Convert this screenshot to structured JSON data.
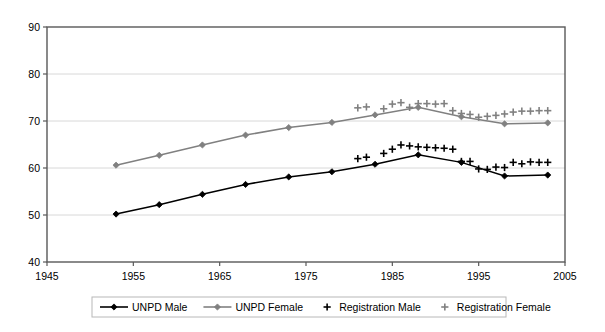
{
  "chart_data": {
    "type": "line",
    "title": "",
    "subtitle": "",
    "xlabel": "",
    "ylabel": "",
    "xlim": [
      1945,
      2005
    ],
    "ylim": [
      40,
      90
    ],
    "xticks": [
      1945,
      1955,
      1965,
      1975,
      1985,
      1995,
      2005
    ],
    "yticks": [
      40,
      50,
      60,
      70,
      80,
      90
    ],
    "grid": "horizontal",
    "legend_position": "bottom",
    "series": [
      {
        "name": "UNPD Male",
        "style": "line-marker",
        "color": "#000000",
        "marker": "diamond",
        "x": [
          1953,
          1958,
          1963,
          1968,
          1973,
          1978,
          1983,
          1988,
          1993,
          1998,
          2003
        ],
        "values": [
          50.2,
          52.2,
          54.4,
          56.5,
          58.1,
          59.2,
          60.8,
          62.8,
          61.2,
          58.3,
          58.5
        ]
      },
      {
        "name": "UNPD Female",
        "style": "line-marker",
        "color": "#808080",
        "marker": "diamond",
        "x": [
          1953,
          1958,
          1963,
          1968,
          1973,
          1978,
          1983,
          1988,
          1993,
          1998,
          2003
        ],
        "values": [
          60.6,
          62.7,
          64.9,
          67.0,
          68.6,
          69.7,
          71.3,
          72.9,
          70.9,
          69.4,
          69.6
        ]
      },
      {
        "name": "Registration Male",
        "style": "markers-only",
        "color": "#000000",
        "marker": "plus",
        "x": [
          1981,
          1982,
          1984,
          1985,
          1986,
          1987,
          1988,
          1989,
          1990,
          1991,
          1992,
          1993,
          1994,
          1995,
          1996,
          1997,
          1998,
          1999,
          2000,
          2001,
          2002,
          2003
        ],
        "values": [
          62.0,
          62.3,
          63.1,
          64.0,
          64.9,
          64.7,
          64.5,
          64.4,
          64.3,
          64.2,
          64.0,
          61.4,
          61.4,
          59.8,
          59.7,
          60.2,
          60.1,
          61.2,
          60.9,
          61.3,
          61.2,
          61.2
        ]
      },
      {
        "name": "Registration Female",
        "style": "markers-only",
        "color": "#808080",
        "marker": "plus",
        "x": [
          1981,
          1982,
          1984,
          1985,
          1986,
          1987,
          1988,
          1989,
          1990,
          1991,
          1992,
          1993,
          1994,
          1995,
          1996,
          1997,
          1998,
          1999,
          2000,
          2001,
          2002,
          2003
        ],
        "values": [
          72.8,
          73.0,
          72.6,
          73.6,
          73.9,
          72.9,
          73.7,
          73.7,
          73.6,
          73.7,
          72.2,
          71.6,
          71.4,
          70.8,
          71.0,
          71.2,
          71.5,
          71.9,
          72.1,
          72.1,
          72.2,
          72.2
        ]
      }
    ]
  },
  "legend": {
    "items": [
      {
        "label": "UNPD Male"
      },
      {
        "label": "UNPD Female"
      },
      {
        "label": "Registration Male"
      },
      {
        "label": "Registration Female"
      }
    ]
  },
  "axes": {
    "y_tick_labels": [
      "90",
      "80",
      "70",
      "60",
      "50",
      "40"
    ],
    "x_tick_labels": [
      "1945",
      "1955",
      "1965",
      "1975",
      "1985",
      "1995",
      "2005"
    ]
  },
  "colors": {
    "male": "#000000",
    "female": "#808080",
    "grid": "#d8d8d8",
    "axis": "#595959",
    "background": "#ffffff"
  }
}
